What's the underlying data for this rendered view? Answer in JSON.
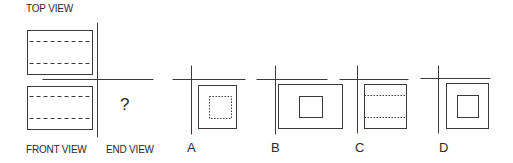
{
  "labels": {
    "top_view": "TOP VIEW",
    "front_view": "FRONT VIEW",
    "end_view": "END VIEW",
    "unknown": "?"
  },
  "colors": {
    "line": "#3a3a3a",
    "text": "#2a2a2a",
    "background": "#ffffff"
  },
  "problem": {
    "top_view": {
      "rect": [
        27,
        30,
        65,
        44
      ],
      "dashed_y": [
        41,
        63
      ]
    },
    "front_view": {
      "rect": [
        27,
        86,
        65,
        43
      ],
      "dashed_y": [
        96,
        118
      ]
    },
    "axes": {
      "vertical_x": 97,
      "vertical_y": [
        22,
        137
      ],
      "horizontal_y": 79,
      "horizontal_x": [
        42,
        153
      ]
    }
  },
  "options": [
    {
      "label": "A",
      "label_pos": [
        187,
        141
      ],
      "axes": {
        "vertical_x": 191,
        "vertical_y": [
          65,
          134
        ],
        "horizontal_y": 79,
        "horizontal_x": [
          172,
          245
        ]
      },
      "outer": [
        198,
        85,
        38,
        43
      ],
      "inner": [
        209,
        96,
        22,
        22
      ],
      "inner_style": "dotted",
      "dotted_lines_y": []
    },
    {
      "label": "B",
      "label_pos": [
        271,
        141
      ],
      "axes": {
        "vertical_x": 275,
        "vertical_y": [
          65,
          134
        ],
        "horizontal_y": 79,
        "horizontal_x": [
          256,
          327
        ]
      },
      "outer": [
        278,
        84,
        64,
        44
      ],
      "inner": [
        299,
        96,
        23,
        21
      ],
      "inner_style": "solid",
      "dotted_lines_y": []
    },
    {
      "label": "C",
      "label_pos": [
        355,
        141
      ],
      "axes": {
        "vertical_x": 357,
        "vertical_y": [
          65,
          133
        ],
        "horizontal_y": 79,
        "horizontal_x": [
          339,
          408
        ]
      },
      "outer": [
        364,
        84,
        42,
        44
      ],
      "inner": null,
      "inner_style": "none",
      "dotted_lines_y": [
        95,
        117
      ]
    },
    {
      "label": "D",
      "label_pos": [
        439,
        141
      ],
      "axes": {
        "vertical_x": 438,
        "vertical_y": [
          65,
          133
        ],
        "horizontal_y": 78,
        "horizontal_x": [
          420,
          490
        ]
      },
      "outer": [
        446,
        83,
        42,
        45
      ],
      "inner": [
        457,
        95,
        21,
        22
      ],
      "inner_style": "solid",
      "dotted_lines_y": []
    }
  ]
}
